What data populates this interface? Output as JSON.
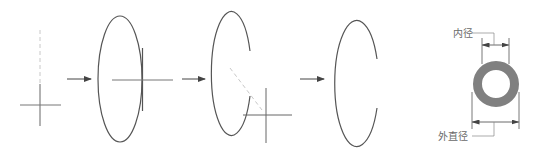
{
  "diagram": {
    "steps": [
      {
        "id": "step-1",
        "shape": "center-cross-with-dashed-axis"
      },
      {
        "id": "step-2",
        "shape": "ellipse-with-cross"
      },
      {
        "id": "step-3",
        "shape": "open-ellipse-with-offset-cross"
      },
      {
        "id": "step-4",
        "shape": "open-ellipse"
      }
    ],
    "arrows": 3,
    "ring": {
      "labels": {
        "inner": "内径",
        "outer": "外直径"
      },
      "fill_color": "#808080"
    },
    "stroke_color": "#555555",
    "guide_color": "#bdbdbd"
  }
}
